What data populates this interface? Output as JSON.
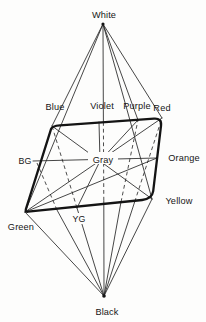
{
  "figure": {
    "type": "color-solid-double-pyramid",
    "labels": {
      "white": "White",
      "black": "Black",
      "gray": "Gray",
      "blue": "Blue",
      "violet": "Violet",
      "purple": "Purple",
      "red": "Red",
      "orange": "Orange",
      "yellow": "Yellow",
      "yg": "YG",
      "green": "Green",
      "bg": "BG"
    },
    "colors": {
      "ink": "#1f1f1f",
      "background": "#fdfdfc"
    }
  }
}
